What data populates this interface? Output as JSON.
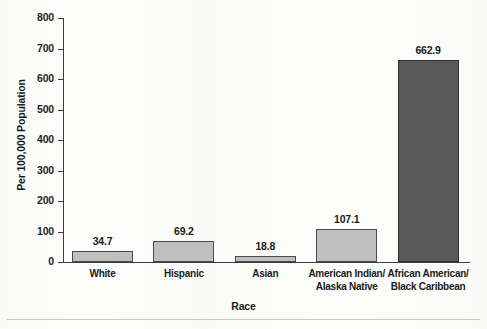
{
  "chart_data": {
    "type": "bar",
    "title": "",
    "xlabel": "Race",
    "ylabel": "Per 100,000 Population",
    "ylim": [
      0,
      800
    ],
    "ytick_labels": [
      "800",
      "700",
      "600",
      "500",
      "400",
      "300",
      "200",
      "100",
      "0"
    ],
    "ytick_values": [
      800,
      700,
      600,
      500,
      400,
      300,
      200,
      100,
      0
    ],
    "grid": false,
    "legend": "none",
    "categories": [
      "White",
      "Hispanic",
      "Asian",
      "American Indian/\nAlaska Native",
      "African American/\nBlack Caribbean"
    ],
    "category_lines": [
      [
        "White"
      ],
      [
        "Hispanic"
      ],
      [
        "Asian"
      ],
      [
        "American Indian/",
        "Alaska Native"
      ],
      [
        "African American/",
        "Black Caribbean"
      ]
    ],
    "values": [
      34.7,
      69.2,
      18.8,
      107.1,
      662.9
    ],
    "value_labels": [
      "34.7",
      "69.2",
      "18.8",
      "107.1",
      "662.9"
    ],
    "bar_colors": [
      "#bfbfbf",
      "#bfbfbf",
      "#bfbfbf",
      "#bfbfbf",
      "#595959"
    ],
    "bar_border_color": "#4a4a4a",
    "axis_color": "#3d3d3d"
  }
}
